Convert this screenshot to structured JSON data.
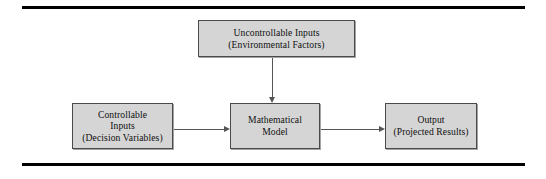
{
  "figure": {
    "background_color": "#ffffff",
    "rule_color": "#000000",
    "node_fill_color": "#d5d5d5",
    "node_border_color": "#4a4a4a",
    "connector_color": "#555555"
  },
  "nodes": {
    "uncontrollable": {
      "line1": "Uncontrollable Inputs",
      "line2": "(Environmental Factors)"
    },
    "controllable": {
      "line1": "Controllable",
      "line2": "Inputs",
      "line3": "(Decision Variables)"
    },
    "model": {
      "line1": "Mathematical",
      "line2": "Model"
    },
    "output": {
      "line1": "Output",
      "line2": "(Projected Results)"
    }
  },
  "connectors": {
    "controllable_to_model": "arrow-right",
    "model_to_output": "arrow-right",
    "uncontrollable_to_model": "arrow-down"
  }
}
